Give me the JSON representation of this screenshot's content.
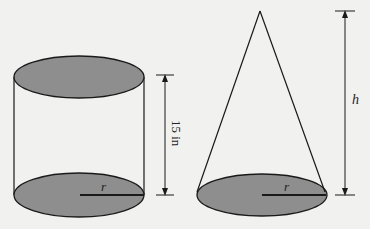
{
  "figure": {
    "colors": {
      "background": "#f1f1ef",
      "stroke": "#1a1a1a",
      "fill": "#8e8e8e"
    },
    "cylinder": {
      "height_label": "15 in",
      "radius_label": "r"
    },
    "cone": {
      "height_label": "h",
      "radius_label": "r"
    }
  }
}
